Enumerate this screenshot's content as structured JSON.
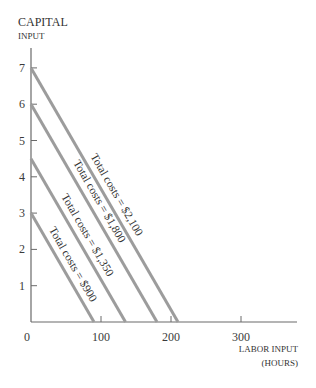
{
  "chart_data": {
    "type": "line",
    "title": "",
    "ylabel": [
      "CAPITAL",
      "INPUT"
    ],
    "xlabel": [
      "LABOR INPUT",
      "(HOURS)"
    ],
    "origin_label": "0",
    "x_ticks": [
      100,
      200,
      300
    ],
    "x_tick_labels": [
      "100",
      "200",
      "300"
    ],
    "y_ticks": [
      1,
      2,
      3,
      4,
      5,
      6,
      7
    ],
    "y_tick_labels": [
      "1",
      "2",
      "3",
      "4",
      "5",
      "6",
      "7"
    ],
    "xlim": [
      0,
      380
    ],
    "ylim": [
      0,
      7.5
    ],
    "grid": false,
    "legend": "none (inline labels along lines)",
    "series": [
      {
        "name": "Total costs = $900",
        "label": "Total costs = $900",
        "x": [
          0,
          90
        ],
        "y": [
          3,
          0
        ]
      },
      {
        "name": "Total costs = $1,350",
        "label": "Total costs = $1,350",
        "x": [
          0,
          135
        ],
        "y": [
          4.5,
          0
        ]
      },
      {
        "name": "Total costs = $1,800",
        "label": "Total costs = $1,800",
        "x": [
          0,
          180
        ],
        "y": [
          6,
          0
        ]
      },
      {
        "name": "Total costs = $2,100",
        "label": "Total costs = $2,100",
        "x": [
          0,
          210
        ],
        "y": [
          7,
          0
        ]
      }
    ],
    "colors": {
      "lines": "#9c9c9c",
      "axes": "#6a6a6a",
      "text": "#333333"
    }
  }
}
